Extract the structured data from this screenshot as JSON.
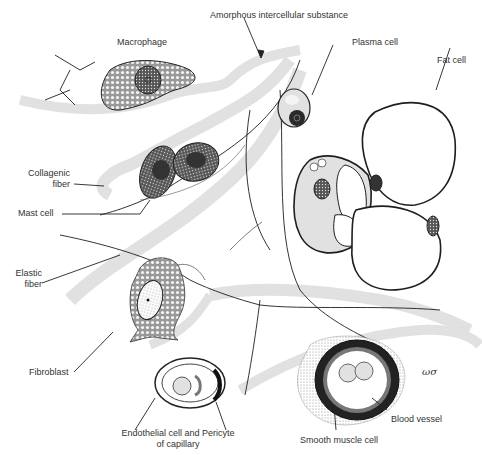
{
  "figure": {
    "type": "histology illustration",
    "labels": [
      {
        "id": "amorphous",
        "text": "Amorphous intercellular substance"
      },
      {
        "id": "macrophage",
        "text": "Macrophage"
      },
      {
        "id": "plasma_cell",
        "text": "Plasma cell"
      },
      {
        "id": "fat_cell",
        "text": "Fat cell"
      },
      {
        "id": "collagenic_fiber",
        "text": "Collagenic\nfiber",
        "lines": [
          "Collagenic",
          "fiber"
        ]
      },
      {
        "id": "mast_cell",
        "text": "Mast cell"
      },
      {
        "id": "elastic_fiber",
        "text": "Elastic\nfiber",
        "lines": [
          "Elastic",
          "fiber"
        ]
      },
      {
        "id": "fibroblast",
        "text": "Fibroblast"
      },
      {
        "id": "endothelial",
        "text": "Endothelial cell and Pericyte of capillary",
        "lines": [
          "Endothelial cell and Pericyte",
          "of capillary"
        ]
      },
      {
        "id": "smooth_muscle",
        "text": "Smooth muscle cell"
      },
      {
        "id": "blood_vessel",
        "text": "Blood vessel"
      }
    ],
    "artist_signature": "ωσ"
  },
  "colors": {
    "ink": "#1e1e1e",
    "stipple": "#8a8a8a",
    "label_text": "#333333",
    "background": "#ffffff"
  }
}
